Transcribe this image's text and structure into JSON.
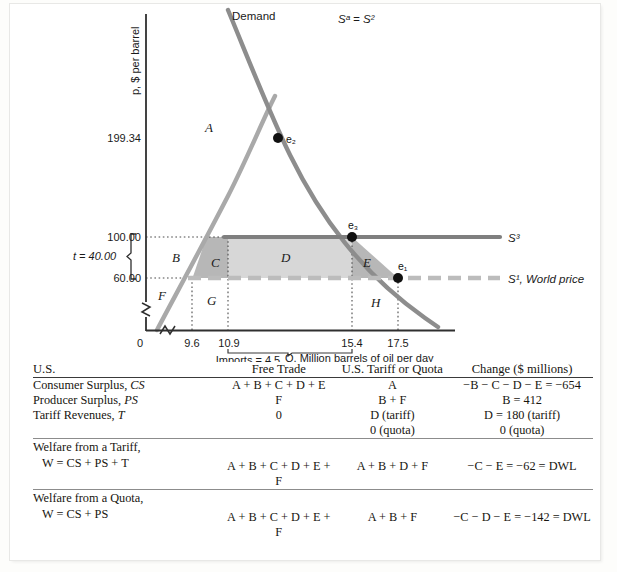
{
  "figure": {
    "y_axis_label": "p, $ per barrel",
    "x_axis_label": "Q, Million barrels of oil per day",
    "y_ticks": [
      "199.34",
      "100.00",
      "60.00"
    ],
    "y_origin": "0",
    "x_ticks": [
      "9.6",
      "10.9",
      "15.4",
      "17.5"
    ],
    "tariff_brace_label": "t = 40.00",
    "imports_label": "Imports = 4.5",
    "curve_labels": {
      "demand": "Demand",
      "supply_domestic": "Sᵃ = S²",
      "supply_tariff": "S³",
      "supply_world": "S¹, World price"
    },
    "equilibrium_points": [
      "e₁",
      "e₂",
      "e₃"
    ],
    "regions": [
      "A",
      "B",
      "C",
      "D",
      "E",
      "F",
      "G",
      "H"
    ],
    "colors": {
      "demand_curve": "#8d8d8d",
      "supply_curve": "#a8a8a8",
      "tariff_line": "#7d7d7d",
      "world_price_line": "#b9b9b9",
      "region_fill_light": "#d6d6d6",
      "region_fill_dark": "#b5b5b5",
      "axis": "#3b3b3b"
    }
  },
  "chart_data": {
    "type": "line",
    "title": "",
    "xlabel": "Q, Million barrels of oil per day",
    "ylabel": "p, $ per barrel",
    "xlim": [
      0,
      20
    ],
    "ylim": [
      0,
      230
    ],
    "grid": false,
    "legend_position": "inline-labels",
    "annotations": [
      "t = 40.00",
      "Imports = 4.5"
    ],
    "series": [
      {
        "name": "Demand",
        "points": [
          [
            10.4,
            230
          ],
          [
            13.3,
            160
          ],
          [
            15.4,
            100
          ],
          [
            17.5,
            60
          ],
          [
            20.1,
            18
          ]
        ]
      },
      {
        "name": "Sᵃ = S²",
        "points": [
          [
            7.6,
            0
          ],
          [
            9.6,
            60
          ],
          [
            10.9,
            100
          ],
          [
            13.3,
            160
          ],
          [
            14.6,
            230
          ]
        ]
      },
      {
        "name": "S³",
        "points": [
          [
            10.9,
            100
          ],
          [
            20.8,
            100
          ]
        ]
      },
      {
        "name": "S¹, World price",
        "points": [
          [
            7.9,
            60
          ],
          [
            20.8,
            60
          ]
        ]
      }
    ],
    "points": [
      {
        "label": "e₂",
        "x": 13.3,
        "y": 199.34
      },
      {
        "label": "e₃",
        "x": 15.4,
        "y": 100.0
      },
      {
        "label": "e₁",
        "x": 17.5,
        "y": 60.0
      }
    ],
    "y_tick_values": [
      199.34,
      100.0,
      60.0
    ],
    "x_tick_values": [
      9.6,
      10.9,
      15.4,
      17.5
    ],
    "shaded_regions": [
      {
        "label": "A",
        "shade": "none"
      },
      {
        "label": "B",
        "shade": "none"
      },
      {
        "label": "C",
        "shade": "dark"
      },
      {
        "label": "D",
        "shade": "light"
      },
      {
        "label": "E",
        "shade": "dark"
      },
      {
        "label": "F",
        "shade": "none"
      },
      {
        "label": "G",
        "shade": "none"
      },
      {
        "label": "H",
        "shade": "none"
      }
    ]
  },
  "table": {
    "headers": {
      "c1": "U.S.",
      "c2": "Free Trade",
      "c3": "U.S. Tariff or Quota",
      "c4": "Change ($ millions)"
    },
    "rows": [
      {
        "label_html": "Consumer Surplus, <i>CS</i>",
        "free_trade": "A + B + C + D + E",
        "tariff_quota": "A",
        "change": "−B − C − D − E = −654"
      },
      {
        "label_html": "Producer Surplus, <i>PS</i>",
        "free_trade": "F",
        "tariff_quota": "B + F",
        "change": "B = 412"
      },
      {
        "label_html": "Tariff Revenues, <i>T</i>",
        "free_trade": "0",
        "tariff_quota": "D (tariff)",
        "change": "D = 180 (tariff)"
      },
      {
        "label_html": "",
        "free_trade": "",
        "tariff_quota": "0 (quota)",
        "change": "0 (quota)"
      }
    ],
    "welfare_rows": [
      {
        "line1": "Welfare from a Tariff,",
        "line2": "W = CS + PS + T",
        "free_trade": "A + B + C + D + E + F",
        "tariff_quota": "A + B + D + F",
        "change": "−C − E = −62 = DWL"
      },
      {
        "line1": "Welfare from a Quota,",
        "line2": "W = CS + PS",
        "free_trade": "A + B + C + D + E + F",
        "tariff_quota": "A + B + F",
        "change": "−C − D − E = −142 = DWL"
      }
    ]
  }
}
